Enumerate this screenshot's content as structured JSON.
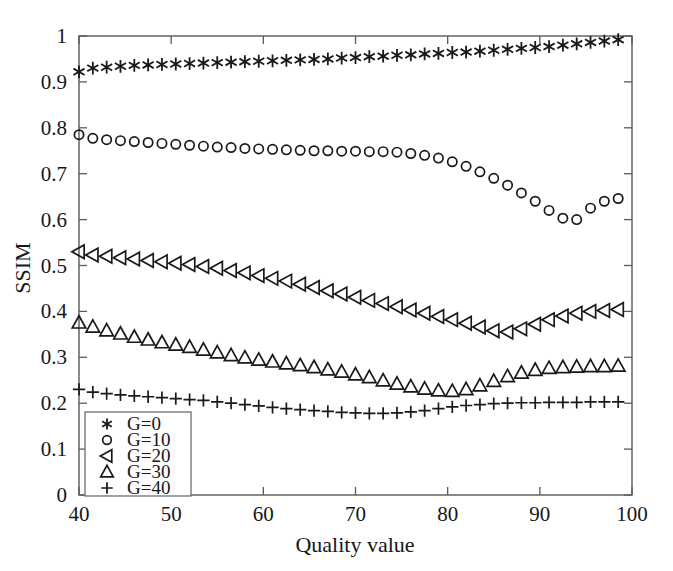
{
  "chart_data": {
    "type": "scatter",
    "title": "",
    "xlabel": "Quality value",
    "ylabel": "SSIM",
    "xlim": [
      40,
      100
    ],
    "ylim": [
      0,
      1
    ],
    "xticks": [
      40,
      50,
      60,
      70,
      80,
      90,
      100
    ],
    "yticks": [
      0,
      0.1,
      0.2,
      0.3,
      0.4,
      0.5,
      0.6,
      0.7,
      0.8,
      0.9,
      1
    ],
    "xtick_labels": [
      "40",
      "50",
      "60",
      "70",
      "80",
      "90",
      "100"
    ],
    "ytick_labels": [
      "0",
      "0.1",
      "0.2",
      "0.3",
      "0.4",
      "0.5",
      "0.6",
      "0.7",
      "0.8",
      "0.9",
      "1"
    ],
    "grid": false,
    "legend_position": "lower-left",
    "marker_only": true,
    "x": [
      40,
      41.5,
      43,
      44.5,
      46,
      47.5,
      49,
      50.5,
      52,
      53.5,
      55,
      56.5,
      58,
      59.5,
      61,
      62.5,
      64,
      65.5,
      67,
      68.5,
      70,
      71.5,
      73,
      74.5,
      76,
      77.5,
      79,
      80.5,
      82,
      83.5,
      85,
      86.5,
      88,
      89.5,
      91,
      92.5,
      94,
      95.5,
      97,
      98.5
    ],
    "series": [
      {
        "name": "G=0",
        "label": "G=0",
        "marker": "asterisk",
        "color": "#17191c",
        "values": [
          0.922,
          0.93,
          0.932,
          0.934,
          0.936,
          0.937,
          0.938,
          0.939,
          0.94,
          0.941,
          0.942,
          0.943,
          0.944,
          0.945,
          0.946,
          0.947,
          0.948,
          0.949,
          0.95,
          0.952,
          0.953,
          0.955,
          0.956,
          0.958,
          0.959,
          0.961,
          0.962,
          0.964,
          0.965,
          0.967,
          0.969,
          0.971,
          0.973,
          0.975,
          0.977,
          0.98,
          0.983,
          0.986,
          0.989,
          0.992
        ]
      },
      {
        "name": "G=10",
        "label": "G=10",
        "marker": "circle",
        "color": "#17191c",
        "values": [
          0.785,
          0.777,
          0.774,
          0.772,
          0.77,
          0.768,
          0.766,
          0.764,
          0.762,
          0.76,
          0.758,
          0.757,
          0.755,
          0.754,
          0.753,
          0.752,
          0.751,
          0.75,
          0.75,
          0.749,
          0.749,
          0.748,
          0.748,
          0.747,
          0.744,
          0.74,
          0.734,
          0.726,
          0.716,
          0.704,
          0.69,
          0.675,
          0.658,
          0.64,
          0.62,
          0.603,
          0.6,
          0.625,
          0.64,
          0.646
        ]
      },
      {
        "name": "G=20",
        "label": "G=20",
        "marker": "triangle-left",
        "color": "#17191c",
        "values": [
          0.53,
          0.523,
          0.52,
          0.517,
          0.514,
          0.511,
          0.508,
          0.505,
          0.502,
          0.498,
          0.494,
          0.489,
          0.484,
          0.478,
          0.472,
          0.466,
          0.459,
          0.452,
          0.445,
          0.438,
          0.431,
          0.424,
          0.417,
          0.41,
          0.403,
          0.396,
          0.389,
          0.382,
          0.374,
          0.366,
          0.358,
          0.355,
          0.362,
          0.372,
          0.382,
          0.39,
          0.396,
          0.4,
          0.402,
          0.404
        ]
      },
      {
        "name": "G=30",
        "label": "G=30",
        "marker": "triangle-up",
        "color": "#17191c",
        "values": [
          0.375,
          0.366,
          0.358,
          0.351,
          0.344,
          0.338,
          0.332,
          0.327,
          0.322,
          0.316,
          0.31,
          0.304,
          0.299,
          0.294,
          0.29,
          0.286,
          0.282,
          0.278,
          0.273,
          0.268,
          0.262,
          0.256,
          0.249,
          0.242,
          0.236,
          0.231,
          0.227,
          0.226,
          0.23,
          0.238,
          0.248,
          0.258,
          0.266,
          0.272,
          0.276,
          0.278,
          0.279,
          0.28,
          0.28,
          0.281
        ]
      },
      {
        "name": "G=40",
        "label": "G=40",
        "marker": "plus",
        "color": "#17191c",
        "values": [
          0.23,
          0.224,
          0.221,
          0.218,
          0.216,
          0.214,
          0.212,
          0.21,
          0.208,
          0.206,
          0.203,
          0.2,
          0.197,
          0.194,
          0.191,
          0.188,
          0.186,
          0.184,
          0.182,
          0.18,
          0.179,
          0.178,
          0.178,
          0.179,
          0.181,
          0.184,
          0.188,
          0.192,
          0.195,
          0.197,
          0.199,
          0.2,
          0.201,
          0.201,
          0.202,
          0.202,
          0.202,
          0.203,
          0.203,
          0.203
        ]
      }
    ],
    "legend": [
      {
        "label": "G=0",
        "marker": "asterisk"
      },
      {
        "label": "G=10",
        "marker": "circle"
      },
      {
        "label": "G=20",
        "marker": "triangle-left"
      },
      {
        "label": "G=30",
        "marker": "triangle-up"
      },
      {
        "label": "G=40",
        "marker": "plus"
      }
    ]
  },
  "geometry": {
    "plot_left": 79,
    "plot_right": 632,
    "plot_top": 36,
    "plot_bottom": 495
  }
}
